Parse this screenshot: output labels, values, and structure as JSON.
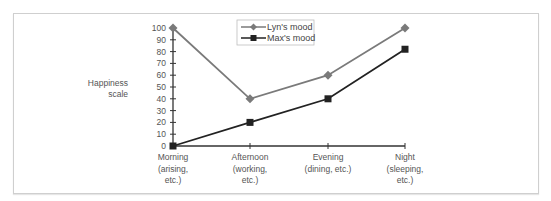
{
  "chart_data": {
    "type": "line",
    "title": "",
    "xlabel": "",
    "ylabel": "Happiness scale",
    "ylim": [
      0,
      100
    ],
    "yticks": [
      0,
      10,
      20,
      30,
      40,
      50,
      60,
      70,
      80,
      90,
      100
    ],
    "categories": [
      "Morning (arising, etc.)",
      "Afternoon (working, etc.)",
      "Evening (dining, etc.)",
      "Night (sleeping, etc.)"
    ],
    "category_lines": [
      [
        "Morning",
        "(arising,",
        "etc.)"
      ],
      [
        "Afternoon",
        "(working,",
        "etc.)"
      ],
      [
        "Evening",
        "(dining, etc.)"
      ],
      [
        "Night",
        "(sleeping,",
        "etc.)"
      ]
    ],
    "series": [
      {
        "name": "Lyn's mood",
        "marker": "diamond",
        "color": "#7a7a7a",
        "values": [
          100,
          40,
          60,
          100
        ]
      },
      {
        "name": "Max's mood",
        "marker": "square",
        "color": "#222222",
        "values": [
          0,
          20,
          40,
          82
        ]
      }
    ],
    "legend_position": "top-center",
    "grid": false
  },
  "axis": {
    "ylabel_line1": "Happiness",
    "ylabel_line2": "scale"
  },
  "legend": {
    "lyn": "Lyn's mood",
    "max": "Max's mood"
  }
}
